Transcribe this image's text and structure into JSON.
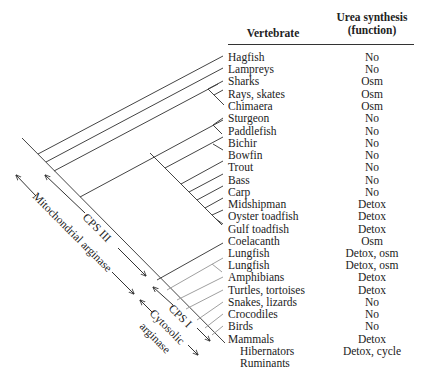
{
  "headers": {
    "vertebrate": "Vertebrate",
    "urea_line1": "Urea synthesis",
    "urea_line2": "(function)"
  },
  "rows": [
    {
      "name": "Hagfish",
      "function": "No"
    },
    {
      "name": "Lampreys",
      "function": "No"
    },
    {
      "name": "Sharks",
      "function": "Osm"
    },
    {
      "name": "Rays, skates",
      "function": "Osm"
    },
    {
      "name": "Chimaera",
      "function": "Osm"
    },
    {
      "name": "Sturgeon",
      "function": "No"
    },
    {
      "name": "Paddlefish",
      "function": "No"
    },
    {
      "name": "Bichir",
      "function": "No"
    },
    {
      "name": "Bowfin",
      "function": "No"
    },
    {
      "name": "Trout",
      "function": "No"
    },
    {
      "name": "Bass",
      "function": "No"
    },
    {
      "name": "Carp",
      "function": "No"
    },
    {
      "name": "Midshipman",
      "function": "Detox"
    },
    {
      "name": "Oyster toadfish",
      "function": "Detox"
    },
    {
      "name": "Gulf toadfish",
      "function": "Detox"
    },
    {
      "name": "Coelacanth",
      "function": "Osm"
    },
    {
      "name": "Lungfish",
      "function": "Detox, osm"
    },
    {
      "name": "Lungfish",
      "function": "Detox, osm"
    },
    {
      "name": "Amphibians",
      "function": "Detox"
    },
    {
      "name": "Turtles, tortoises",
      "function": "Detox"
    },
    {
      "name": "Snakes, lizards",
      "function": "No"
    },
    {
      "name": "Crocodiles",
      "function": "No"
    },
    {
      "name": "Birds",
      "function": "No"
    },
    {
      "name": "Mammals",
      "function": "Detox"
    },
    {
      "name": "Hibernators",
      "function": "Detox, cycle"
    },
    {
      "name": "Ruminants",
      "function": ""
    }
  ],
  "annotations": {
    "cps3": "CPS III",
    "mito_arginase": "Mitochondrial arginase",
    "cps1": "CPS I",
    "cytosolic": "Cytosolic",
    "arginase": "arginase"
  },
  "colors": {
    "line_dark": "#444444",
    "line_light": "#a0a0a0",
    "text": "#222222"
  }
}
